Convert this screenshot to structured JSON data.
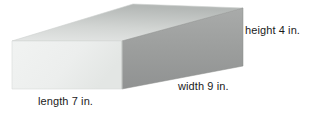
{
  "figure": {
    "name": "rectangular-prism",
    "labels": {
      "height": "height 4 in.",
      "width": "width 9 in.",
      "length": "length 7 in."
    },
    "dimensions": {
      "height_value": 4,
      "width_value": 9,
      "length_value": 7,
      "unit": "in."
    },
    "colors": {
      "background": "#ffffff",
      "front_face": "#eef0ef",
      "front_face_shade": "#e2e5e3",
      "top_face_light": "#dcdedd",
      "top_face_dark": "#b6bab8",
      "side_face_light": "#a8a9a8",
      "side_face_dark": "#8e908f",
      "edge_stroke": "#c9cbca",
      "text": "#1a1a1a"
    },
    "geometry": {
      "front_top_left": [
        12,
        41
      ],
      "front_top_right": [
        122,
        41
      ],
      "front_bottom_right": [
        122,
        89
      ],
      "front_bottom_left": [
        12,
        89
      ],
      "back_top_left": [
        133,
        4
      ],
      "back_top_right": [
        243,
        8
      ],
      "side_bottom_right": [
        243,
        66
      ]
    }
  }
}
